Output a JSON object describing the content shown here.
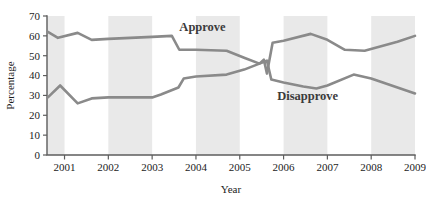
{
  "chart_data": {
    "type": "line",
    "title": "",
    "xlabel": "Year",
    "ylabel": "Percentage",
    "xlim": [
      2000.6,
      2009.0
    ],
    "ylim": [
      0,
      70
    ],
    "ytick_step": 10,
    "grid": false,
    "legend_position": "inline-annotation",
    "xticks": [
      "2001",
      "2002",
      "2003",
      "2004",
      "2005",
      "2006",
      "2007",
      "2008",
      "2009"
    ],
    "xtick_values": [
      2001,
      2002,
      2003,
      2004,
      2005,
      2006,
      2007,
      2008,
      2009
    ],
    "yticks": [
      "0",
      "10",
      "20",
      "30",
      "40",
      "50",
      "60",
      "70"
    ],
    "ytick_values": [
      0,
      10,
      20,
      30,
      40,
      50,
      60,
      70
    ],
    "shaded_bands": [
      {
        "start": 2000.6,
        "end": 2001.0
      },
      {
        "start": 2002.0,
        "end": 2003.0
      },
      {
        "start": 2004.0,
        "end": 2005.0
      },
      {
        "start": 2006.0,
        "end": 2007.0
      },
      {
        "start": 2008.0,
        "end": 2009.0
      }
    ],
    "series": [
      {
        "name": "Approve",
        "color": "#8a8a8a",
        "label_x": 2004.15,
        "label_y": 62.5,
        "x": [
          2000.62,
          2000.85,
          2001.3,
          2001.62,
          2002.0,
          2003.0,
          2003.45,
          2003.62,
          2004.0,
          2004.7,
          2005.1,
          2005.45,
          2005.55,
          2005.62,
          2005.75,
          2006.0,
          2006.62,
          2007.0,
          2007.4,
          2007.85,
          2008.6,
          2009.0
        ],
        "values": [
          62,
          59,
          61.5,
          58,
          58.5,
          59.5,
          60,
          53,
          53,
          52.5,
          49,
          46,
          48,
          41,
          56.5,
          57.5,
          61,
          58,
          53,
          52.5,
          57,
          60
        ]
      },
      {
        "name": "Disapprove",
        "color": "#8a8a8a",
        "label_x": 2006.55,
        "label_y": 27.5,
        "x": [
          2000.62,
          2000.9,
          2001.3,
          2001.62,
          2002.0,
          2003.0,
          2003.2,
          2003.6,
          2003.72,
          2004.0,
          2004.7,
          2005.1,
          2005.45,
          2005.62,
          2005.72,
          2006.0,
          2006.45,
          2006.75,
          2007.0,
          2007.6,
          2008.0,
          2009.0
        ],
        "values": [
          29,
          35,
          26,
          28.5,
          29,
          29,
          30.5,
          34,
          38.5,
          39.5,
          40.5,
          43,
          46,
          47.5,
          38,
          36.5,
          34.5,
          33.5,
          35,
          40.5,
          38.5,
          31
        ]
      }
    ]
  },
  "labels": {
    "approve": "Approve",
    "disapprove": "Disapprove",
    "x_axis_title": "Year",
    "y_axis_title": "Percentage"
  }
}
